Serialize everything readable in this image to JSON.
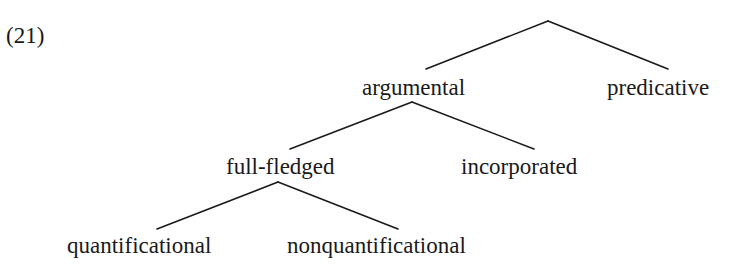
{
  "example_number": "(21)",
  "tree": {
    "root": {
      "label": ""
    },
    "nodes": {
      "argumental": "argumental",
      "predicative": "predicative",
      "full_fledged": "full-fledged",
      "incorporated": "incorporated",
      "quantificational": "quantificational",
      "nonquantificational": "nonquantificational"
    },
    "edges": [
      [
        "root",
        "argumental"
      ],
      [
        "root",
        "predicative"
      ],
      [
        "argumental",
        "full-fledged"
      ],
      [
        "argumental",
        "incorporated"
      ],
      [
        "full-fledged",
        "quantificational"
      ],
      [
        "full-fledged",
        "nonquantificational"
      ]
    ]
  }
}
